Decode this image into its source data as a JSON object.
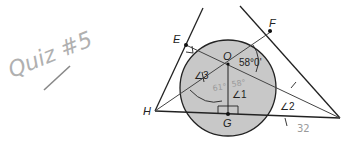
{
  "handwriting": {
    "title": "Quiz #5",
    "angle_left_value": "61°",
    "angle_right_value": "58°",
    "bottom_value": "32"
  },
  "diagram": {
    "points": {
      "E": "E",
      "F": "F",
      "O": "O",
      "G": "G",
      "H": "H"
    },
    "angles": {
      "angle3": "∠3",
      "angle1": "∠1",
      "angle2": "∠2",
      "given": "58°0'"
    },
    "colors": {
      "circle_fill": "#c8c8c8",
      "line": "#222222",
      "handwriting": "#a0a0a0"
    }
  }
}
